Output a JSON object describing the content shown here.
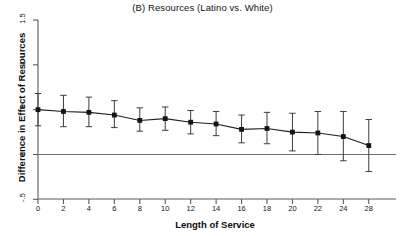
{
  "chart_data": {
    "type": "line",
    "title": "(B) Resources (Latino vs. White)",
    "xlabel": "Length of Service",
    "ylabel": "Difference in Effect of Resources",
    "x": [
      0,
      2,
      4,
      6,
      8,
      10,
      12,
      14,
      16,
      18,
      20,
      22,
      24,
      28
    ],
    "values": [
      0.5,
      0.48,
      0.47,
      0.44,
      0.38,
      0.4,
      0.36,
      0.34,
      0.28,
      0.29,
      0.25,
      0.24,
      0.2,
      0.1
    ],
    "error_low": [
      0.32,
      0.31,
      0.31,
      0.3,
      0.26,
      0.27,
      0.23,
      0.21,
      0.13,
      0.12,
      0.04,
      0.0,
      -0.07,
      -0.19
    ],
    "error_high": [
      0.68,
      0.66,
      0.64,
      0.6,
      0.52,
      0.53,
      0.49,
      0.48,
      0.44,
      0.47,
      0.46,
      0.48,
      0.48,
      0.39
    ],
    "xticks": [
      0,
      2,
      4,
      6,
      8,
      10,
      12,
      14,
      16,
      18,
      20,
      22,
      24,
      28
    ],
    "xtick_labels": [
      "0",
      "2",
      "4",
      "6",
      "8",
      "10",
      "12",
      "14",
      "16",
      "18",
      "20",
      "22",
      "24",
      "28"
    ],
    "yticks": [
      -0.5,
      0,
      0.5,
      1,
      1.5
    ],
    "ytick_labels": [
      "-.5",
      "0",
      ".5",
      "1",
      "1.5"
    ],
    "ylim": [
      -0.55,
      1.55
    ],
    "xlim": [
      -1.2,
      29.2
    ],
    "grid": false,
    "legend": null,
    "zero_reference_line": 0,
    "marker": "filled-square",
    "series_color": "#1a1a1a",
    "errorbar_color": "#3c3c3c",
    "axis_color": "#555555"
  }
}
